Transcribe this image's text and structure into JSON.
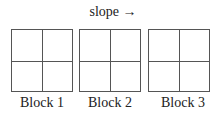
{
  "title": "slope →",
  "blocks": [
    {
      "label": "Block 1",
      "rows": 2,
      "cols": 2
    },
    {
      "label": "Block 2",
      "rows": 2,
      "cols": 2
    },
    {
      "label": "Block 3",
      "rows": 2,
      "cols": 2
    }
  ],
  "colors": {
    "line": "#555555",
    "text": "#222222",
    "background": "#ffffff"
  }
}
